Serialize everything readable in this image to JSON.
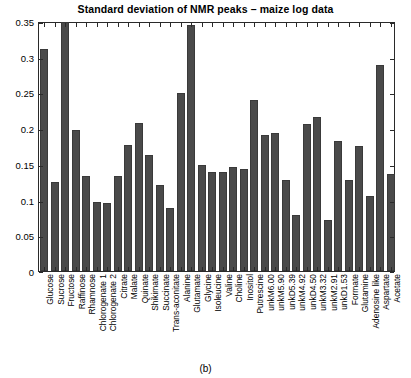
{
  "chart_data": {
    "type": "bar",
    "title": "Standard deviation of NMR peaks – maize log data",
    "xlabel": "",
    "ylabel": "",
    "ylim": [
      0,
      0.35
    ],
    "yticks": [
      0,
      0.05,
      0.1,
      0.15,
      0.2,
      0.25,
      0.3,
      0.35
    ],
    "ytick_labels": [
      "0",
      "0.05",
      "0.1",
      "0.15",
      "0.2",
      "0.25",
      "0.3",
      "0.35"
    ],
    "grid": false,
    "legend": null,
    "bar_color": "#4a4a4a",
    "categories": [
      "Glucose",
      "Sucrose",
      "Fructose",
      "Raffinose",
      "Rhamnose",
      "Chlorogenate 1",
      "Chlorogenate 2",
      "Citrate",
      "Malate",
      "Quinate",
      "Shikimate",
      "Succinate",
      "Trans-aconitate",
      "Alanine",
      "Glutamate",
      "Glycine",
      "Isoleucine",
      "Valine",
      "Choline",
      "Inositol",
      "Putrescine",
      "unkM6.00",
      "unkM5.90",
      "unkD5.39",
      "unkM4.92",
      "unkD4.50",
      "unkM3.32",
      "unkM2.91",
      "unkD1.53",
      "Formate",
      "Glutamine",
      "Adenosine like",
      "Aspartate",
      "Acetate"
    ],
    "values": [
      0.311,
      0.124,
      0.349,
      0.197,
      0.133,
      0.096,
      0.095,
      0.133,
      0.176,
      0.207,
      0.163,
      0.121,
      0.088,
      0.249,
      0.344,
      0.149,
      0.139,
      0.139,
      0.145,
      0.143,
      0.24,
      0.19,
      0.193,
      0.127,
      0.078,
      0.206,
      0.216,
      0.072,
      0.182,
      0.128,
      0.175,
      0.105,
      0.288,
      0.136
    ]
  },
  "caption": "(b)"
}
